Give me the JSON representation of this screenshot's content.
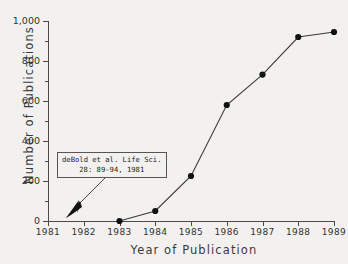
{
  "chart_data": {
    "type": "line",
    "title": "",
    "xlabel": "Year of Publication",
    "ylabel": "Number of Publications",
    "categories": [
      "1981",
      "1982",
      "1983",
      "1984",
      "1985",
      "1986",
      "1987",
      "1988",
      "1989"
    ],
    "x": [
      1981,
      1982,
      1983,
      1984,
      1985,
      1986,
      1987,
      1988,
      1989
    ],
    "values": [
      null,
      null,
      0,
      50,
      225,
      580,
      732,
      920,
      945
    ],
    "series": [
      {
        "name": "Publications",
        "values": [
          null,
          null,
          0,
          50,
          225,
          580,
          732,
          920,
          945
        ]
      }
    ],
    "xlim": [
      1981,
      1989
    ],
    "ylim": [
      0,
      1000
    ],
    "ytick_labels": [
      "0",
      "200",
      "400",
      "600",
      "800",
      "1,000"
    ],
    "ytick_values": [
      0,
      200,
      400,
      600,
      800,
      1000
    ],
    "yminor_values": [
      100,
      300,
      500,
      700,
      900
    ],
    "xtick_labels": [
      "1981",
      "1982",
      "1983",
      "1984",
      "1985",
      "1986",
      "1987",
      "1988",
      "1989"
    ],
    "grid": false,
    "legend": false,
    "marker": "filled-circle",
    "line_color": "#3a3a3a",
    "marker_color": "#111111",
    "background_color": "#f2f1ef",
    "annotations": [
      {
        "name": "debold-citation",
        "line1": "deBold et al. Life Sci.",
        "line2": "28: 89-94, 1981",
        "points_to_year": 1981.5,
        "points_to_value": 0
      }
    ]
  },
  "axes": {
    "y_title": "Number of Publications",
    "x_title": "Year of Publication"
  },
  "annotation": {
    "line1": "deBold et al. Life Sci.",
    "line2": "28: 89-94, 1981"
  }
}
